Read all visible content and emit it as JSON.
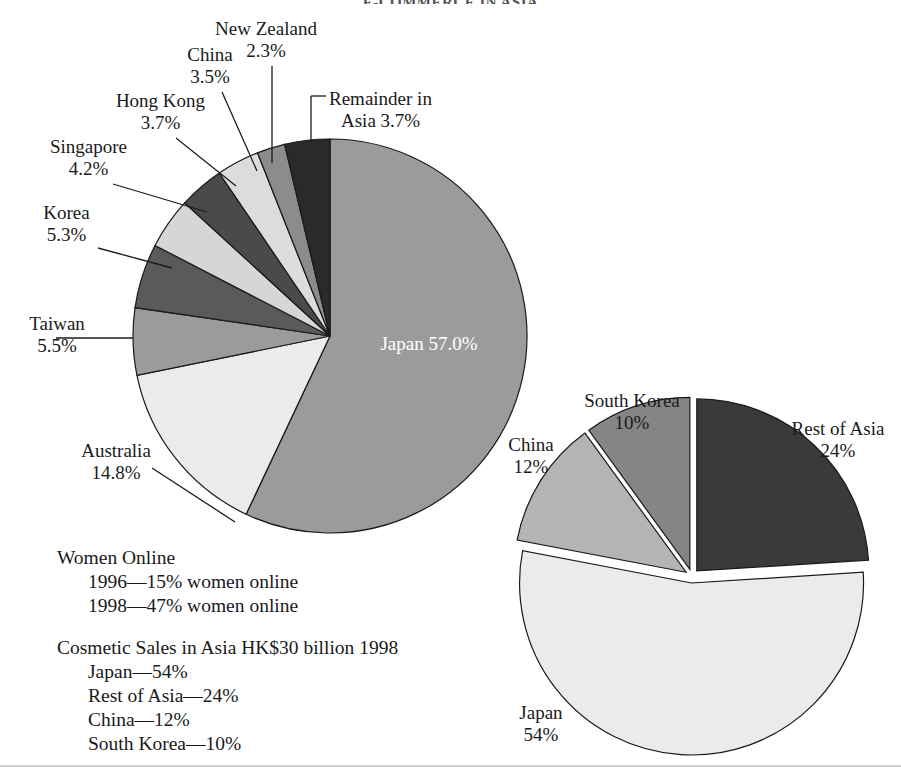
{
  "page": {
    "title_partial": "E-COMMERCE IN ASIA",
    "background": "#ffffff"
  },
  "chart_data": [
    {
      "type": "pie",
      "id": "internet-users-asia-pacific",
      "title": "",
      "legend": "labels-with-leader-lines",
      "center_label_series": "Japan",
      "categories": [
        "Japan",
        "Australia",
        "Taiwan",
        "Korea",
        "Singapore",
        "Hong Kong",
        "China",
        "New Zealand",
        "Remainder in Asia"
      ],
      "values": [
        57.0,
        14.8,
        5.5,
        5.3,
        4.2,
        3.7,
        3.5,
        2.3,
        3.7
      ],
      "value_labels": [
        "57.0%",
        "14.8%",
        "5.5%",
        "5.3%",
        "4.2%",
        "3.7%",
        "3.5%",
        "2.3%",
        "3.7%"
      ],
      "colors": [
        "#9b9b9b",
        "#ebebeb",
        "#9b9b9b",
        "#5a5a5a",
        "#d6d6d6",
        "#4a4a4a",
        "#dcdcdc",
        "#8c8c8c",
        "#2a2a2a"
      ],
      "start_angle_deg": 0,
      "direction": "clockwise",
      "exploded": false
    },
    {
      "type": "pie",
      "id": "cosmetic-sales-in-asia",
      "title": "",
      "legend": "labels-outside",
      "categories": [
        "Rest of Asia",
        "Japan",
        "China",
        "South Korea"
      ],
      "values": [
        24,
        54,
        12,
        10
      ],
      "value_labels": [
        "24%",
        "54%",
        "12%",
        "10%"
      ],
      "colors": [
        "#3a3a3a",
        "#ebebeb",
        "#b4b4b4",
        "#858585"
      ],
      "start_angle_deg": 0,
      "direction": "clockwise",
      "exploded": true
    }
  ],
  "pie1": {
    "labels": [
      {
        "name": "label-new-zealand",
        "l1": "New Zealand",
        "l2": "2.3%",
        "align": "ctr"
      },
      {
        "name": "label-china",
        "l1": "China",
        "l2": "3.5%",
        "align": "ctr"
      },
      {
        "name": "label-hong-kong",
        "l1": "Hong Kong",
        "l2": "3.7%",
        "align": "ctr"
      },
      {
        "name": "label-singapore",
        "l1": "Singapore",
        "l2": "4.2%",
        "align": "ctr"
      },
      {
        "name": "label-korea",
        "l1": "Korea",
        "l2": "5.3%",
        "align": "ctr"
      },
      {
        "name": "label-taiwan",
        "l1": "Taiwan",
        "l2": "5.5%",
        "align": "ctr"
      },
      {
        "name": "label-australia",
        "l1": "Australia",
        "l2": "14.8%",
        "align": "ctr"
      },
      {
        "name": "label-remainder-in-asia",
        "l1": "Remainder in",
        "l2": "Asia 3.7%",
        "align": "lft"
      }
    ],
    "center": {
      "name": "Japan",
      "pct": "57.0%"
    }
  },
  "pie2": {
    "labels": [
      {
        "name": "label2-south-korea",
        "l1": "South Korea",
        "l2": "10%"
      },
      {
        "name": "label2-china",
        "l1": "China",
        "l2": "12%"
      },
      {
        "name": "label2-rest-of-asia",
        "l1": "Rest of Asia",
        "l2": "24%"
      },
      {
        "name": "label2-japan",
        "l1": "Japan",
        "l2": "54%"
      }
    ]
  },
  "notes": {
    "block1": {
      "heading": "Women Online",
      "items": [
        "1996—15% women online",
        "1998—47% women online"
      ]
    },
    "block2": {
      "heading": "Cosmetic Sales in Asia HK$30 billion 1998",
      "items": [
        "Japan—54%",
        "Rest of Asia—24%",
        "China—12%",
        "South Korea—10%"
      ]
    }
  }
}
